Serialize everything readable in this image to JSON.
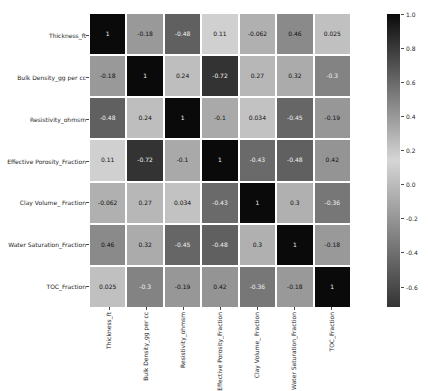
{
  "chart_data": {
    "type": "heatmap",
    "subtype": "correlation-matrix",
    "variables": [
      "Thickness_ft",
      "Bulk Density_gg per cc",
      "Resistivity_ohmsm",
      "Effective Porosity_Fraction",
      "Clay Volume_ Fraction",
      "Water Saturation_Fraction",
      "TOC_Fraction"
    ],
    "matrix": [
      [
        1,
        -0.18,
        -0.48,
        0.11,
        -0.062,
        0.46,
        0.025
      ],
      [
        -0.18,
        1,
        0.24,
        -0.72,
        0.27,
        0.32,
        -0.3
      ],
      [
        -0.48,
        0.24,
        1,
        -0.1,
        0.034,
        -0.45,
        -0.19
      ],
      [
        0.11,
        -0.72,
        -0.1,
        1,
        -0.43,
        -0.48,
        0.42
      ],
      [
        -0.062,
        0.27,
        0.034,
        -0.43,
        1,
        0.3,
        -0.36
      ],
      [
        0.46,
        0.32,
        -0.45,
        -0.48,
        0.3,
        1,
        -0.18
      ],
      [
        0.025,
        -0.3,
        -0.19,
        0.42,
        -0.36,
        -0.18,
        1
      ]
    ],
    "colorbar": {
      "position": "right",
      "vmin": -0.72,
      "vmax": 1.0,
      "tick_values": [
        1.0,
        0.8,
        0.6,
        0.4,
        0.2,
        0.0,
        -0.2,
        -0.4,
        -0.6
      ],
      "tick_labels": [
        "1.0",
        "0.8",
        "0.6",
        "0.4",
        "0.2",
        "0.0",
        "-0.2",
        "-0.4",
        "-0.6"
      ]
    },
    "colors": {
      "background": "#ffffff",
      "gridline": "#ffffff",
      "center_light": "#d6d6d6",
      "positive_extreme_dark": "#0a0a0a",
      "negative_extreme_dark": "#333333",
      "annotation_dark_text": "#111111",
      "annotation_light_text": "#f2f2f2",
      "axis_text": "#262626",
      "center_value": 0.14
    },
    "layout": {
      "grid_gaps": "white",
      "x_tick_label_rotation": 90,
      "legend_position": "right-colorbar"
    }
  }
}
